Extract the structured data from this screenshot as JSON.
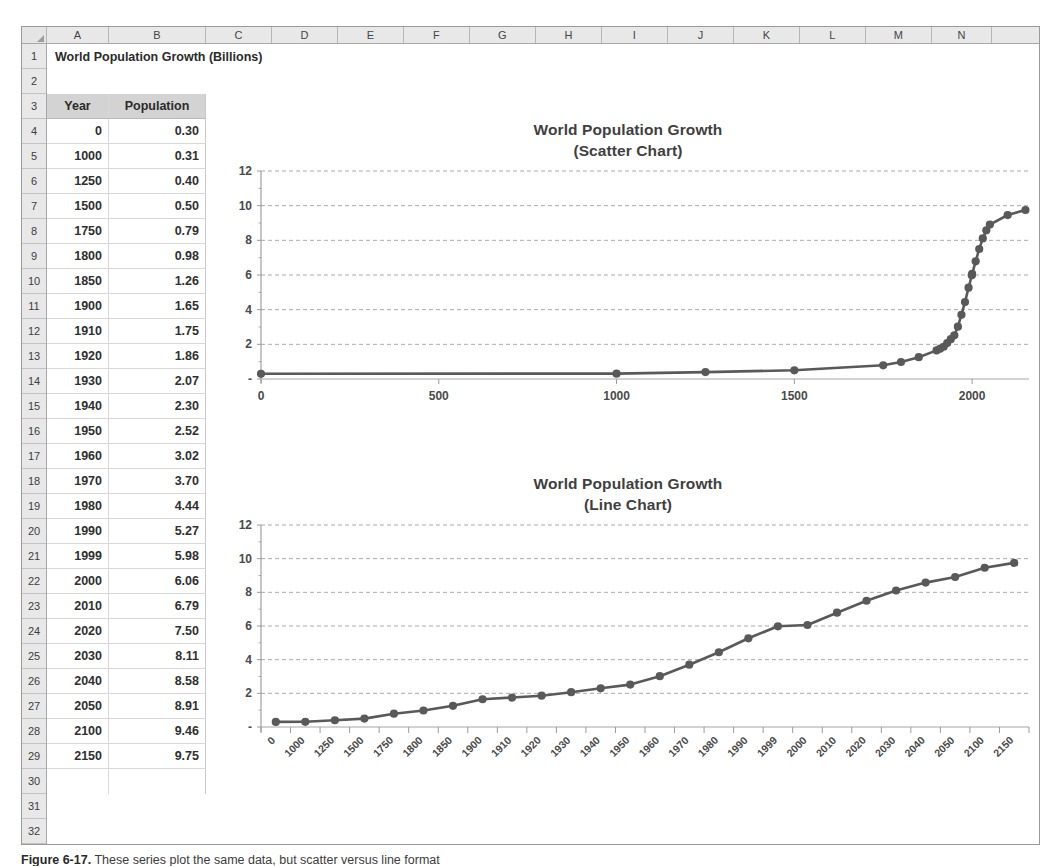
{
  "spreadsheet": {
    "column_headers": [
      "A",
      "B",
      "C",
      "D",
      "E",
      "F",
      "G",
      "H",
      "I",
      "J",
      "K",
      "L",
      "M",
      "N"
    ],
    "row_headers": [
      "1",
      "2",
      "3",
      "4",
      "5",
      "6",
      "7",
      "8",
      "9",
      "10",
      "11",
      "12",
      "13",
      "14",
      "15",
      "16",
      "17",
      "18",
      "19",
      "20",
      "21",
      "22",
      "23",
      "24",
      "25",
      "26",
      "27",
      "28",
      "29",
      "30",
      "31",
      "32",
      "33",
      "34"
    ],
    "sheet_title": "World Population Growth (Billions)",
    "table_headers": {
      "year": "Year",
      "population": "Population"
    },
    "rows": [
      {
        "year": "0",
        "population": "0.30"
      },
      {
        "year": "1000",
        "population": "0.31"
      },
      {
        "year": "1250",
        "population": "0.40"
      },
      {
        "year": "1500",
        "population": "0.50"
      },
      {
        "year": "1750",
        "population": "0.79"
      },
      {
        "year": "1800",
        "population": "0.98"
      },
      {
        "year": "1850",
        "population": "1.26"
      },
      {
        "year": "1900",
        "population": "1.65"
      },
      {
        "year": "1910",
        "population": "1.75"
      },
      {
        "year": "1920",
        "population": "1.86"
      },
      {
        "year": "1930",
        "population": "2.07"
      },
      {
        "year": "1940",
        "population": "2.30"
      },
      {
        "year": "1950",
        "population": "2.52"
      },
      {
        "year": "1960",
        "population": "3.02"
      },
      {
        "year": "1970",
        "population": "3.70"
      },
      {
        "year": "1980",
        "population": "4.44"
      },
      {
        "year": "1990",
        "population": "5.27"
      },
      {
        "year": "1999",
        "population": "5.98"
      },
      {
        "year": "2000",
        "population": "6.06"
      },
      {
        "year": "2010",
        "population": "6.79"
      },
      {
        "year": "2020",
        "population": "7.50"
      },
      {
        "year": "2030",
        "population": "8.11"
      },
      {
        "year": "2040",
        "population": "8.58"
      },
      {
        "year": "2050",
        "population": "8.91"
      },
      {
        "year": "2100",
        "population": "9.46"
      },
      {
        "year": "2150",
        "population": "9.75"
      }
    ]
  },
  "chart_data": [
    {
      "type": "scatter",
      "title": "World Population Growth",
      "subtitle": "(Scatter Chart)",
      "xlabel": "",
      "ylabel": "",
      "xlim": [
        0,
        2160
      ],
      "ylim": [
        0,
        12
      ],
      "xticks": [
        "0",
        "500",
        "1000",
        "1500",
        "2000"
      ],
      "xtick_values": [
        0,
        500,
        1000,
        1500,
        2000
      ],
      "yticks": [
        "-",
        "2",
        "4",
        "6",
        "8",
        "10",
        "12"
      ],
      "ytick_values": [
        0,
        2,
        4,
        6,
        8,
        10,
        12
      ],
      "grid": true,
      "legend": "none",
      "marker_color": "#595959",
      "line_color": "#595959",
      "x": [
        0,
        1000,
        1250,
        1500,
        1750,
        1800,
        1850,
        1900,
        1910,
        1920,
        1930,
        1940,
        1950,
        1960,
        1970,
        1980,
        1990,
        1999,
        2000,
        2010,
        2020,
        2030,
        2040,
        2050,
        2100,
        2150
      ],
      "y": [
        0.3,
        0.31,
        0.4,
        0.5,
        0.79,
        0.98,
        1.26,
        1.65,
        1.75,
        1.86,
        2.07,
        2.3,
        2.52,
        3.02,
        3.7,
        4.44,
        5.27,
        5.98,
        6.06,
        6.79,
        7.5,
        8.11,
        8.58,
        8.91,
        9.46,
        9.75
      ]
    },
    {
      "type": "line",
      "title": "World Population Growth",
      "subtitle": "(Line Chart)",
      "xlabel": "",
      "ylabel": "",
      "ylim": [
        0,
        12
      ],
      "categories": [
        "0",
        "1000",
        "1250",
        "1500",
        "1750",
        "1800",
        "1850",
        "1900",
        "1910",
        "1920",
        "1930",
        "1940",
        "1950",
        "1960",
        "1970",
        "1980",
        "1990",
        "1999",
        "2000",
        "2010",
        "2020",
        "2030",
        "2040",
        "2050",
        "2100",
        "2150"
      ],
      "values": [
        0.3,
        0.31,
        0.4,
        0.5,
        0.79,
        0.98,
        1.26,
        1.65,
        1.75,
        1.86,
        2.07,
        2.3,
        2.52,
        3.02,
        3.7,
        4.44,
        5.27,
        5.98,
        6.06,
        6.79,
        7.5,
        8.11,
        8.58,
        8.91,
        9.46,
        9.75
      ],
      "yticks": [
        "-",
        "2",
        "4",
        "6",
        "8",
        "10",
        "12"
      ],
      "ytick_values": [
        0,
        2,
        4,
        6,
        8,
        10,
        12
      ],
      "grid": true,
      "legend": "none",
      "marker_color": "#595959",
      "line_color": "#595959"
    }
  ],
  "caption": {
    "figure_label": "Figure 6-17.",
    "text": "These series plot the same data, but scatter versus line format"
  }
}
